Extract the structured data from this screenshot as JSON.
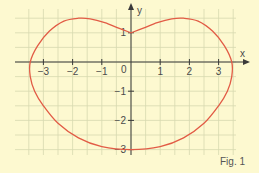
{
  "figure_label": "Fig. 1",
  "colors": {
    "background": "#fdf9d0",
    "grid": "#d7d9b0",
    "axis": "#3a3a3a",
    "curve": "#e25b45",
    "text": "#4a4a4a"
  },
  "chart_data": {
    "type": "line",
    "title": "",
    "xlabel": "x",
    "ylabel": "y",
    "xlim": [
      -3.9,
      3.6
    ],
    "ylim": [
      -3.2,
      1.8
    ],
    "grid": true,
    "grid_step": 0.5,
    "x_ticks": [
      -3,
      -2,
      -1,
      1,
      2,
      3
    ],
    "y_ticks": [
      1,
      -1,
      -2,
      -3
    ],
    "origin_label": "0",
    "series": [
      {
        "name": "closed curve",
        "closed": true,
        "points": [
          [
            0,
            1
          ],
          [
            0.4,
            1.15
          ],
          [
            0.9,
            1.35
          ],
          [
            1.4,
            1.48
          ],
          [
            1.8,
            1.5
          ],
          [
            2.3,
            1.4
          ],
          [
            2.8,
            1.05
          ],
          [
            3.2,
            0.55
          ],
          [
            3.45,
            0
          ],
          [
            3.45,
            -0.5
          ],
          [
            3.3,
            -1.0
          ],
          [
            3.0,
            -1.5
          ],
          [
            2.5,
            -2.1
          ],
          [
            1.8,
            -2.6
          ],
          [
            1.0,
            -2.9
          ],
          [
            0,
            -3
          ],
          [
            -1.0,
            -2.9
          ],
          [
            -1.8,
            -2.6
          ],
          [
            -2.5,
            -2.1
          ],
          [
            -3.0,
            -1.5
          ],
          [
            -3.3,
            -1.0
          ],
          [
            -3.45,
            -0.5
          ],
          [
            -3.45,
            0
          ],
          [
            -3.2,
            0.55
          ],
          [
            -2.8,
            1.05
          ],
          [
            -2.3,
            1.4
          ],
          [
            -1.8,
            1.5
          ],
          [
            -1.4,
            1.48
          ],
          [
            -0.9,
            1.35
          ],
          [
            -0.4,
            1.15
          ],
          [
            0,
            1
          ]
        ]
      }
    ]
  }
}
